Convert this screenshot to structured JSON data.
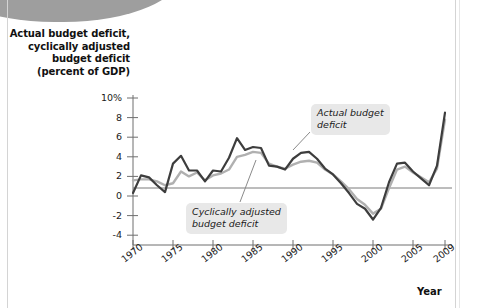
{
  "chart_data": {
    "type": "line",
    "title": "Actual budget deficit, cyclically adjusted budget deficit (percent of GDP)",
    "xlabel": "Year",
    "ylabel": "",
    "ylim": [
      -5,
      10
    ],
    "xlim": [
      1970,
      2009
    ],
    "grid": false,
    "legend_position": "inline-annotations",
    "yticks": [
      "10%",
      "8",
      "6",
      "4",
      "2",
      "0",
      "-2",
      "-4"
    ],
    "ytick_values": [
      10,
      8,
      6,
      4,
      2,
      0,
      -2,
      -4
    ],
    "xticks": [
      "1970",
      "1975",
      "1980",
      "1985",
      "1990",
      "1995",
      "2000",
      "2005",
      "2009"
    ],
    "xtick_values": [
      1970,
      1975,
      1980,
      1985,
      1990,
      1995,
      2000,
      2005,
      2009
    ],
    "x": [
      1970,
      1971,
      1972,
      1973,
      1974,
      1975,
      1976,
      1977,
      1978,
      1979,
      1980,
      1981,
      1982,
      1983,
      1984,
      1985,
      1986,
      1987,
      1988,
      1989,
      1990,
      1991,
      1992,
      1993,
      1994,
      1995,
      1996,
      1997,
      1998,
      1999,
      2000,
      2001,
      2002,
      2003,
      2004,
      2005,
      2006,
      2007,
      2008,
      2009
    ],
    "series": [
      {
        "name": "Actual budget deficit",
        "color": "#3d3d3d",
        "values": [
          0.3,
          2.1,
          1.9,
          1.1,
          0.4,
          3.3,
          4.1,
          2.6,
          2.6,
          1.5,
          2.6,
          2.5,
          3.9,
          5.9,
          4.7,
          5.0,
          4.9,
          3.1,
          3.0,
          2.7,
          3.8,
          4.4,
          4.5,
          3.8,
          2.8,
          2.2,
          1.3,
          0.3,
          -0.8,
          -1.3,
          -2.4,
          -1.2,
          1.4,
          3.3,
          3.4,
          2.5,
          1.8,
          1.1,
          3.1,
          8.5
        ]
      },
      {
        "name": "Cyclically adjusted budget deficit",
        "color": "#b0b0b0",
        "values": [
          1.6,
          1.7,
          1.7,
          1.5,
          1.1,
          1.3,
          2.5,
          2.0,
          2.4,
          1.6,
          2.1,
          2.3,
          2.7,
          4.0,
          4.2,
          4.5,
          4.4,
          3.3,
          3.0,
          2.8,
          3.2,
          3.5,
          3.6,
          3.4,
          2.7,
          2.2,
          1.5,
          0.7,
          -0.3,
          -0.9,
          -1.8,
          -1.3,
          0.8,
          2.7,
          3.0,
          2.4,
          1.9,
          1.4,
          2.8,
          7.8
        ]
      }
    ],
    "annotations": [
      {
        "id": "actual",
        "text": "Actual budget\ndeficit"
      },
      {
        "id": "cyclical",
        "text": "Cyclically adjusted\nbudget deficit"
      }
    ]
  }
}
